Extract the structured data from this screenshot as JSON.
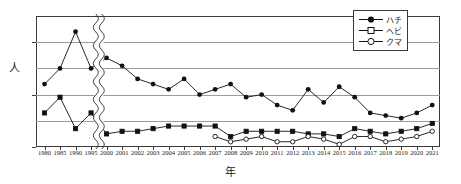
{
  "chart_data": {
    "type": "line",
    "title": "",
    "xlabel": "年",
    "ylabel": "人",
    "ylim": [
      0,
      50
    ],
    "yticks": [
      0,
      20,
      40
    ],
    "ytick_labels": [
      "0",
      "20",
      "40"
    ],
    "gridlines": [
      10,
      20,
      30,
      40
    ],
    "grid": true,
    "legend_position": "top-right",
    "axis_break": {
      "between": [
        "1995",
        "2000"
      ],
      "note": "x-axis break between 1995 and 2000"
    },
    "categories": [
      "1980",
      "1985",
      "1990",
      "1995",
      "2000",
      "2001",
      "2002",
      "2003",
      "2004",
      "2005",
      "2006",
      "2007",
      "2008",
      "2009",
      "2010",
      "2011",
      "2012",
      "2013",
      "2014",
      "2015",
      "2016",
      "2017",
      "2018",
      "2019",
      "2020",
      "2021"
    ],
    "series": [
      {
        "name": "ハチ",
        "marker": "filled-circle",
        "color": "#111111",
        "values": [
          24,
          30,
          44,
          30,
          34,
          31,
          26,
          24,
          22,
          26,
          20,
          22,
          24,
          19,
          20,
          16,
          14,
          22,
          17,
          23,
          19,
          13,
          12,
          11,
          13,
          16
        ]
      },
      {
        "name": "ヘビ",
        "marker": "open-square",
        "color": "#111111",
        "values": [
          13,
          19,
          7,
          13,
          5,
          6,
          6,
          7,
          8,
          8,
          8,
          8,
          4,
          6,
          6,
          6,
          6,
          5,
          5,
          4,
          7,
          6,
          5,
          6,
          7,
          9
        ]
      },
      {
        "name": "クマ",
        "marker": "open-circle",
        "color": "#111111",
        "values": [
          null,
          null,
          null,
          null,
          null,
          null,
          null,
          null,
          null,
          null,
          null,
          4,
          2,
          3,
          4,
          2,
          2,
          4,
          3,
          1,
          4,
          4,
          2,
          3,
          4,
          6
        ]
      }
    ]
  },
  "legend": {
    "items": [
      {
        "label": "ハチ",
        "marker": "filled-circle"
      },
      {
        "label": "ヘビ",
        "marker": "open-square"
      },
      {
        "label": "クマ",
        "marker": "open-circle"
      }
    ]
  }
}
